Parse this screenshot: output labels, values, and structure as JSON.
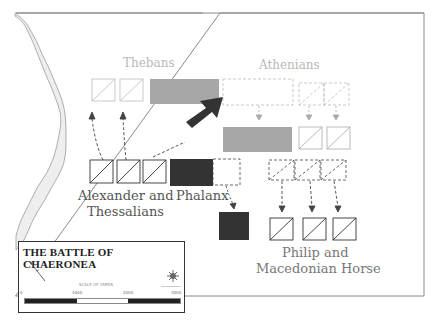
{
  "map": {
    "title": "THE BATTLE OF CHAERONEA",
    "labels": {
      "thebans": "Thebans",
      "athenians": "Athenians",
      "alexander_line1": "Alexander and",
      "alexander_line2": "Thessalians",
      "phalanx": "Phalanx",
      "philip_line1": "Philip and",
      "philip_line2": "Macedonian Horse"
    },
    "legend": {
      "scale_caption": "SCALE OF YARDS",
      "ticks": [
        "0",
        "1000",
        "2000",
        "3000"
      ],
      "north_icon": "north-arrow-icon",
      "compass_icon": "compass-rose-icon"
    },
    "colors": {
      "frame": "#8a8a8a",
      "allied_text": "#b8b8b8",
      "macedonian_text": "#555555",
      "allied_fill": "#a7a7a7",
      "macedonian_fill": "#333333",
      "river_fill": "#eeeeee",
      "river_line": "#999999"
    }
  }
}
